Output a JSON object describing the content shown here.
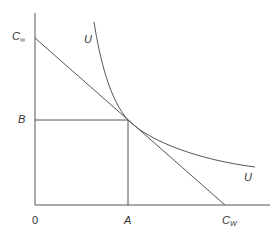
{
  "diagram": {
    "type": "economics-indifference-curve",
    "colors": {
      "line": "#555555",
      "text": "#333333",
      "background": "#ffffff"
    },
    "labels": {
      "y_intercept_main": "C",
      "y_intercept_sub": "∞",
      "x_intercept_main": "C",
      "x_intercept_sub": "W",
      "origin": "0",
      "y_point": "B",
      "x_point": "A",
      "curve_top": "U",
      "curve_right": "U"
    },
    "geometry": {
      "origin": [
        35,
        205
      ],
      "y_axis_top": [
        35,
        13
      ],
      "x_axis_right": [
        270,
        205
      ],
      "budget_line": {
        "from": [
          35,
          38
        ],
        "to": [
          225,
          205
        ]
      },
      "tangent_point": [
        128,
        120
      ],
      "indifference_curve": {
        "start": [
          94,
          22
        ],
        "tangent": [
          128,
          120
        ],
        "end": [
          255,
          167
        ]
      }
    }
  }
}
